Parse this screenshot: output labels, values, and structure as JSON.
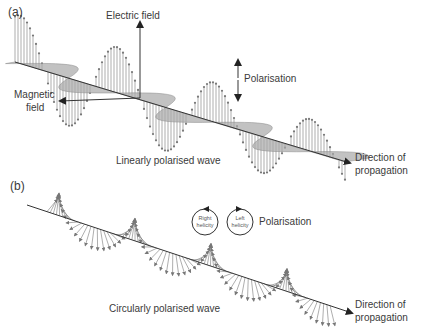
{
  "figure": {
    "panels": [
      {
        "id": "a",
        "label": "(a)",
        "caption": "Linearly polarised wave",
        "labels": {
          "electric_field": "Electric field",
          "magnetic_field_line1": "Magnetic",
          "magnetic_field_line2": "field",
          "polarisation": "Polarisation",
          "direction_line1": "Direction of",
          "direction_line2": "propagation"
        }
      },
      {
        "id": "b",
        "label": "(b)",
        "caption": "Circularly polarised wave",
        "labels": {
          "polarisation": "Polarisation",
          "right_helicity_line1": "Right",
          "right_helicity_line2": "helicity",
          "left_helicity_line1": "Left",
          "left_helicity_line2": "helicity",
          "direction_line1": "Direction of",
          "direction_line2": "propagation"
        }
      }
    ],
    "colors": {
      "line": "#3a3a3a",
      "vector": "#777777",
      "sheet_fill": "#a8a8a8"
    }
  }
}
